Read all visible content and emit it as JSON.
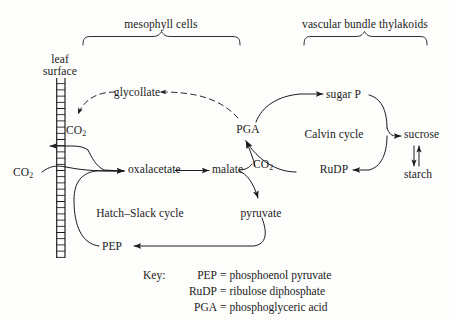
{
  "figure": {
    "background": "#fdfdfc",
    "ink": "#1a1a1a"
  },
  "sections": {
    "mesophyll": "mesophyll cells",
    "vascular": "vascular bundle thylakoids"
  },
  "nodes": {
    "leaf_surface_line1": "leaf",
    "leaf_surface_line2": "surface",
    "co2_external": "CO",
    "co2_external_sub": "2",
    "co2_internal": "CO",
    "co2_internal_sub": "2",
    "co2_released": "CO",
    "co2_released_sub": "2",
    "glycollate": "glycollate",
    "pga": "PGA",
    "sugar_p": "sugar P",
    "calvin": "Calvin cycle",
    "sucrose": "sucrose",
    "starch": "starch",
    "rudp": "RuDP",
    "oxaloacetate": "oxalacetate",
    "malate": "malate",
    "pyruvate": "pyruvate",
    "pep": "PEP",
    "hatch_slack": "Hatch–Slack cycle"
  },
  "key": {
    "heading": "Key:",
    "entries": [
      {
        "abbr": "PEP",
        "eq": "=",
        "expansion": "phosphoenol pyruvate"
      },
      {
        "abbr": "RuDP",
        "eq": "=",
        "expansion": "ribulose diphosphate"
      },
      {
        "abbr": "PGA",
        "eq": "=",
        "expansion": "phosphoglyceric acid"
      }
    ]
  }
}
